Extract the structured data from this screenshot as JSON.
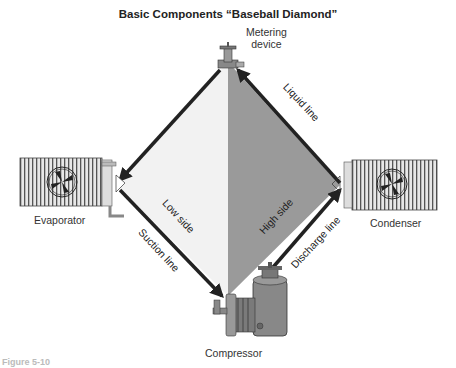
{
  "title": "Basic Components “Baseball Diamond”",
  "components": {
    "metering_device": "Metering\ndevice",
    "evaporator": "Evaporator",
    "condenser": "Condenser",
    "compressor": "Compressor"
  },
  "lines": {
    "liquid_line": "Liquid line",
    "suction_line": "Suction line",
    "discharge_line": "Discharge line"
  },
  "sides": {
    "low_side": "Low side",
    "high_side": "High side"
  },
  "colors": {
    "low_side_fill": "#f2f2f2",
    "high_side_fill": "#9a9a9a",
    "line_color": "#222222"
  },
  "figure_caption": "Figure 5-10"
}
